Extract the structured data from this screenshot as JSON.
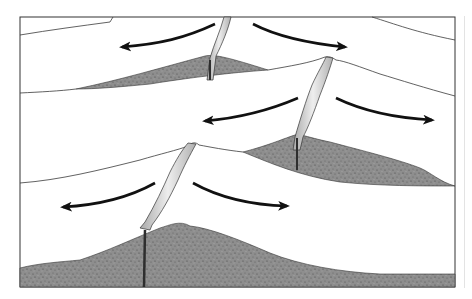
{
  "diagram": {
    "colors": {
      "background": "#ffffff",
      "frame": "#333333",
      "outline": "#3a3a3a",
      "crust_fill": "#8e8e8e",
      "crust_speckle": "#555555",
      "magma_fill_light": "#e6e6e6",
      "magma_fill_dark": "#9a9a9a",
      "magma_feeder": "#2e2e2e",
      "arrow": "#111111"
    },
    "ridge_segments": [
      {
        "id": "upper",
        "crest_x": 208,
        "crest_y": 30
      },
      {
        "id": "middle",
        "crest_x": 330,
        "crest_y": 58
      },
      {
        "id": "lower",
        "crest_x": 193,
        "crest_y": 143
      }
    ],
    "arrows": [
      {
        "segment": "upper",
        "direction": "left"
      },
      {
        "segment": "upper",
        "direction": "right"
      },
      {
        "segment": "middle",
        "direction": "left"
      },
      {
        "segment": "middle",
        "direction": "right"
      },
      {
        "segment": "lower",
        "direction": "left"
      },
      {
        "segment": "lower",
        "direction": "right"
      }
    ]
  }
}
